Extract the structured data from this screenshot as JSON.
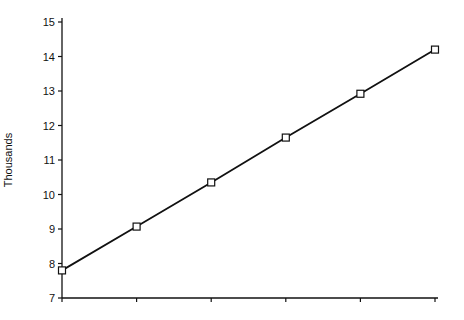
{
  "chart_data": {
    "type": "line",
    "title": "",
    "xlabel": "",
    "ylabel": "Thousands",
    "x": [
      1,
      2,
      3,
      4,
      5,
      6
    ],
    "categories": [
      "",
      "",
      "",
      "",
      "",
      ""
    ],
    "series": [
      {
        "name": "series-1",
        "values": [
          7.8,
          9.07,
          10.35,
          11.65,
          12.92,
          14.2
        ],
        "marker": "square",
        "color": "#111111"
      }
    ],
    "ylim": [
      7,
      15
    ],
    "yticks": [
      7,
      8,
      9,
      10,
      11,
      12,
      13,
      14,
      15
    ],
    "grid": false,
    "legend": "none"
  }
}
